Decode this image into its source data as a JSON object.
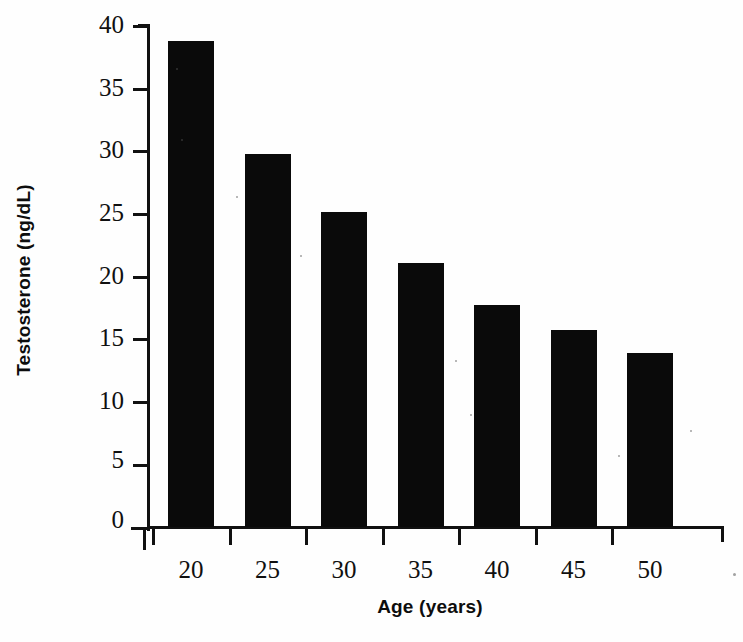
{
  "chart_data": {
    "type": "bar",
    "title": "",
    "xlabel": "Age (years)",
    "ylabel": "Testosterone (ng/dL)",
    "categories": [
      "20",
      "25",
      "30",
      "35",
      "40",
      "45",
      "50"
    ],
    "values": [
      38.7,
      29.7,
      25.1,
      21.0,
      17.7,
      15.7,
      13.8
    ],
    "series": [
      {
        "name": "Testosterone",
        "values": [
          38.7,
          29.7,
          25.1,
          21.0,
          17.7,
          15.7,
          13.8
        ]
      }
    ],
    "ylim": [
      0,
      40
    ],
    "yticks": [
      "0",
      "5",
      "10",
      "15",
      "20",
      "25",
      "30",
      "35",
      "40"
    ],
    "ytick_values": [
      0,
      5,
      10,
      15,
      20,
      25,
      30,
      35,
      40
    ],
    "xtick_labels": [
      "20",
      "25",
      "30",
      "35",
      "40",
      "45",
      "50"
    ],
    "grid": false,
    "legend": false,
    "bar_color": "#0a0a0a",
    "background_color": "#ffffff",
    "axis_color": "#111111"
  }
}
